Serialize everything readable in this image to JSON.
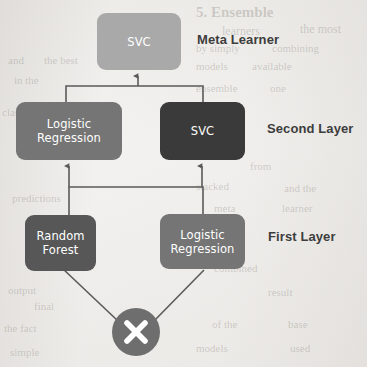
{
  "diagram": {
    "background_color": "#f2f1ef",
    "edge_color": "#5a5a5a",
    "nodes": {
      "meta": {
        "label": "SVC",
        "color": "#a9a9a9",
        "x": 97,
        "y": 13,
        "w": 84,
        "h": 57
      },
      "second_left": {
        "label_line1": "Logistic",
        "label_line2": "Regression",
        "color": "#757575",
        "x": 16,
        "y": 102,
        "w": 106,
        "h": 58
      },
      "second_right": {
        "label": "SVC",
        "color": "#3a3a3a",
        "x": 160,
        "y": 102,
        "w": 85,
        "h": 58
      },
      "first_left": {
        "label_line1": "Random",
        "label_line2": "Forest",
        "color": "#575757",
        "x": 25,
        "y": 215,
        "w": 71,
        "h": 56
      },
      "first_right": {
        "label_line1": "Logistic",
        "label_line2": "Regression",
        "color": "#757575",
        "x": 160,
        "y": 214,
        "w": 85,
        "h": 55
      },
      "input": {
        "icon": "x-cross-icon",
        "color": "#6e6e6e",
        "cx": 136,
        "cy": 332,
        "r": 24
      }
    },
    "layer_labels": [
      {
        "text": "Meta Learner",
        "x": 197,
        "y": 32
      },
      {
        "text": "Second Layer",
        "x": 267,
        "y": 121
      },
      {
        "text": "First Layer",
        "x": 268,
        "y": 229
      }
    ],
    "ghost_text": [
      {
        "text": "5. Ensemble",
        "x": 196,
        "y": 4,
        "size": 15,
        "weight": "bold"
      },
      {
        "text": "learners",
        "x": 222,
        "y": 24,
        "size": 12,
        "weight": "normal"
      },
      {
        "text": "the most",
        "x": 300,
        "y": 22,
        "size": 12,
        "weight": "normal"
      },
      {
        "text": "by simply",
        "x": 196,
        "y": 42,
        "size": 11,
        "weight": "normal"
      },
      {
        "text": "combining",
        "x": 272,
        "y": 42,
        "size": 11,
        "weight": "normal"
      },
      {
        "text": "and",
        "x": 8,
        "y": 54,
        "size": 11,
        "weight": "normal"
      },
      {
        "text": "the best",
        "x": 44,
        "y": 54,
        "size": 11,
        "weight": "normal"
      },
      {
        "text": "models",
        "x": 196,
        "y": 60,
        "size": 11,
        "weight": "normal"
      },
      {
        "text": "available",
        "x": 252,
        "y": 60,
        "size": 11,
        "weight": "normal"
      },
      {
        "text": "in the",
        "x": 14,
        "y": 74,
        "size": 11,
        "weight": "normal"
      },
      {
        "text": "ensemble",
        "x": 196,
        "y": 82,
        "size": 11,
        "weight": "normal"
      },
      {
        "text": "one",
        "x": 270,
        "y": 82,
        "size": 11,
        "weight": "normal"
      },
      {
        "text": "class",
        "x": 2,
        "y": 106,
        "size": 11,
        "weight": "normal"
      },
      {
        "text": "from",
        "x": 250,
        "y": 160,
        "size": 11,
        "weight": "normal"
      },
      {
        "text": "stacked",
        "x": 196,
        "y": 180,
        "size": 11,
        "weight": "normal"
      },
      {
        "text": "and the",
        "x": 284,
        "y": 182,
        "size": 11,
        "weight": "normal"
      },
      {
        "text": "predictions",
        "x": 12,
        "y": 192,
        "size": 11,
        "weight": "normal"
      },
      {
        "text": "meta",
        "x": 214,
        "y": 202,
        "size": 11,
        "weight": "normal"
      },
      {
        "text": "learner",
        "x": 282,
        "y": 202,
        "size": 11,
        "weight": "normal"
      },
      {
        "text": "output",
        "x": 8,
        "y": 284,
        "size": 11,
        "weight": "normal"
      },
      {
        "text": "combined",
        "x": 214,
        "y": 262,
        "size": 11,
        "weight": "normal"
      },
      {
        "text": "final",
        "x": 34,
        "y": 300,
        "size": 11,
        "weight": "normal"
      },
      {
        "text": "result",
        "x": 268,
        "y": 286,
        "size": 11,
        "weight": "normal"
      },
      {
        "text": "the fact",
        "x": 4,
        "y": 322,
        "size": 11,
        "weight": "normal"
      },
      {
        "text": "of the",
        "x": 212,
        "y": 318,
        "size": 11,
        "weight": "normal"
      },
      {
        "text": "base",
        "x": 288,
        "y": 318,
        "size": 11,
        "weight": "normal"
      },
      {
        "text": "simple",
        "x": 10,
        "y": 346,
        "size": 11,
        "weight": "normal"
      },
      {
        "text": "models",
        "x": 196,
        "y": 342,
        "size": 11,
        "weight": "normal"
      },
      {
        "text": "used",
        "x": 290,
        "y": 342,
        "size": 11,
        "weight": "normal"
      }
    ]
  }
}
